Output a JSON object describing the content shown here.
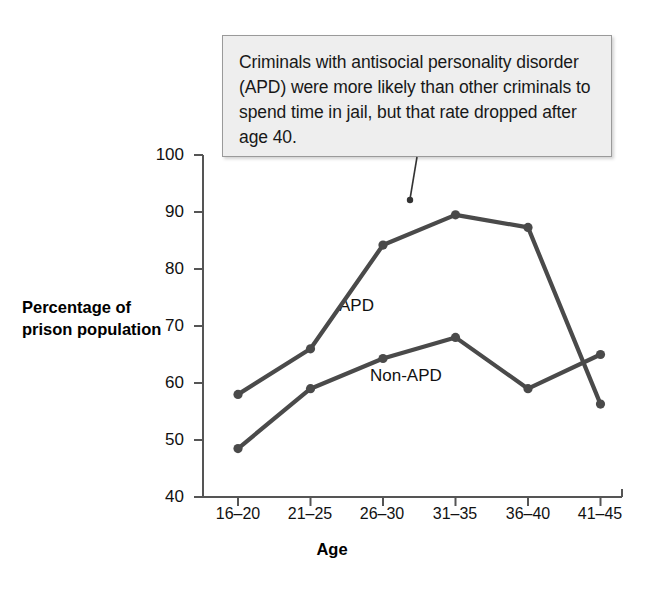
{
  "annotation": {
    "text": "Criminals with antisocial personality disorder (APD) were more likely than other criminals to spend time in jail, but that rate dropped after age 40."
  },
  "colors": {
    "line": "#4a4a4a",
    "axis": "#555555",
    "callout_background": "#eeeeee",
    "callout_border": "#9a9a9a",
    "text": "#111111"
  },
  "chart_data": {
    "type": "line",
    "title": "",
    "xlabel": "Age",
    "ylabel": "Percentage of prison population",
    "categories": [
      "16–20",
      "21–25",
      "26–30",
      "31–35",
      "36–40",
      "41–45"
    ],
    "yticks": [
      40,
      50,
      60,
      70,
      80,
      90,
      100
    ],
    "ylim": [
      40,
      100
    ],
    "grid": false,
    "legend": "inline-labels",
    "series": [
      {
        "name": "APD",
        "values": [
          58.0,
          66.0,
          84.2,
          89.5,
          87.3,
          56.3
        ]
      },
      {
        "name": "Non-APD",
        "values": [
          48.5,
          59.0,
          64.3,
          68.0,
          59.0,
          65.0
        ]
      }
    ],
    "annotations": [
      {
        "text": "Criminals with antisocial personality disorder (APD) were more likely than other criminals to spend time in jail, but that rate dropped after age 40.",
        "points_to": "APD line between 26–30 and 31–35"
      }
    ]
  }
}
